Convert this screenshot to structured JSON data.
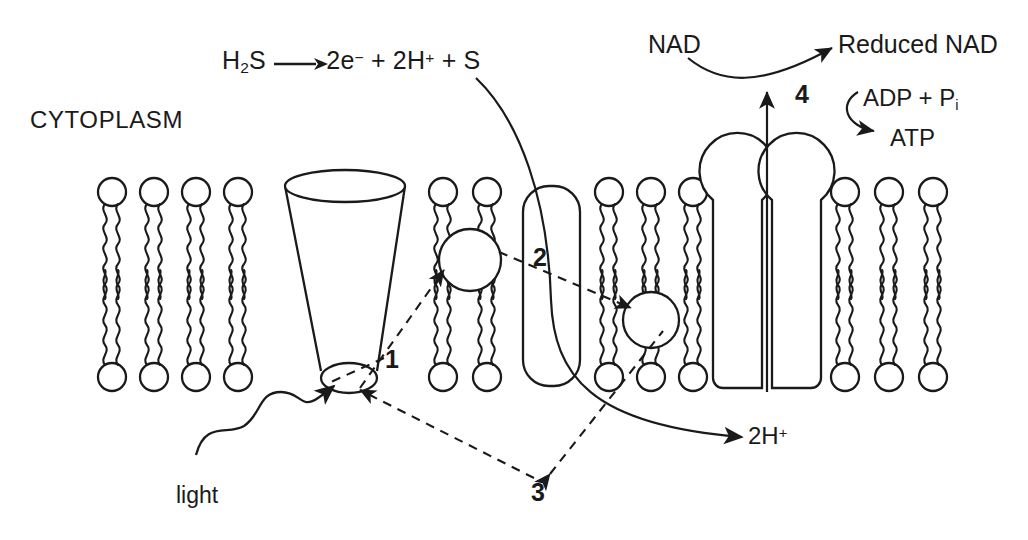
{
  "figure": {
    "kind": "bacterial-membrane-diagram",
    "title_visible": false,
    "stroke_color": "#1a1a1a",
    "fill_color": "#ffffff",
    "background": "#ffffff"
  },
  "labels": {
    "cytoplasm": "CYTOPLASM",
    "light": "light",
    "two_h_plus": "2H",
    "two_h_plus_sup": "+",
    "nad": "NAD",
    "reduced_nad": "Reduced NAD",
    "adp_pi": "ADP + P",
    "adp_pi_sub": "i",
    "atp": "ATP"
  },
  "equation": {
    "reactant": "H",
    "reactant_sub": "2",
    "reactant_tail": "S",
    "arrow": "→",
    "products": "2e",
    "products_sup1": "−",
    "products_mid": " + 2H",
    "products_sup2": "+",
    "products_tail": " + S",
    "full_text": "H2S → 2e− + 2H+ + S"
  },
  "numbered_labels": [
    {
      "id": "1",
      "text": "1",
      "refers_to": "light-harvesting-reaction-centre"
    },
    {
      "id": "2",
      "text": "2",
      "refers_to": "membrane-protein-complex"
    },
    {
      "id": "3",
      "text": "3",
      "refers_to": "electron-carriers"
    },
    {
      "id": "4",
      "text": "4",
      "refers_to": "atp-synthase"
    }
  ],
  "components": {
    "bilayer": {
      "name": "phospholipid-bilayer",
      "upper_leaflet_head_y": 192,
      "lower_leaflet_head_y": 377,
      "head_radius": 14,
      "lipid_groups": [
        {
          "name": "left-lipids",
          "count": 4,
          "x_start": 112,
          "spacing": 42
        },
        {
          "name": "mid-lipids",
          "count": 2,
          "x_start": 443,
          "spacing": 44
        },
        {
          "name": "right-mid-lipids",
          "count": 3,
          "x_start": 609,
          "spacing": 42
        },
        {
          "name": "far-right-lipids",
          "count": 3,
          "x_start": 845,
          "spacing": 44
        }
      ]
    },
    "cone": {
      "name": "light-harvesting-complex",
      "top_cx": 345,
      "top_cy": 186,
      "top_rx": 60,
      "top_ry": 16,
      "bottom_cx": 349,
      "bottom_cy": 378,
      "bottom_rx": 28,
      "bottom_ry": 15
    },
    "carrier_a": {
      "name": "electron-carrier-upper",
      "cx": 470,
      "cy": 260,
      "r": 31
    },
    "carrier_b": {
      "name": "electron-carrier-lower",
      "cx": 651,
      "cy": 320,
      "r": 28
    },
    "protein2": {
      "name": "membrane-protein-complex",
      "x": 523,
      "y": 186,
      "w": 57,
      "h": 200,
      "radius": 26
    },
    "atp_synthase": {
      "name": "atp-synthase",
      "left_head_cx": 722,
      "right_head_cx": 812,
      "head_cy": 135,
      "head_r": 38,
      "channel_x": 767,
      "stalk_top": 96,
      "base_y": 388
    }
  },
  "arrows": {
    "light_squiggle": {
      "name": "light-arrow",
      "from": [
        196,
        452
      ],
      "to": [
        332,
        392
      ]
    },
    "h2s_curve": {
      "name": "h2s-electron-curve",
      "from": [
        476,
        78
      ],
      "to": [
        700,
        440
      ]
    },
    "proton_channel": {
      "name": "proton-flow-arrow",
      "from": [
        767,
        390
      ],
      "to": [
        767,
        92
      ]
    },
    "nad_curve": {
      "name": "nad-reduction-arrow",
      "from": [
        690,
        58
      ],
      "to": [
        830,
        50
      ]
    },
    "atp_curve": {
      "name": "atp-synthesis-arrow",
      "from": [
        855,
        96
      ],
      "to": [
        880,
        131
      ]
    },
    "dashed": [
      {
        "name": "dashed-1-reaction-centre",
        "points": [
          [
            382,
            360
          ],
          [
            330,
            383
          ]
        ]
      },
      {
        "name": "dashed-carrier-a",
        "points": [
          [
            362,
            387
          ],
          [
            441,
            270
          ]
        ]
      },
      {
        "name": "dashed-carrier-b",
        "points": [
          [
            500,
            252
          ],
          [
            632,
            307
          ]
        ]
      },
      {
        "name": "dashed-3-left",
        "points": [
          [
            536,
            481
          ],
          [
            355,
            390
          ]
        ]
      },
      {
        "name": "dashed-3-right",
        "points": [
          [
            548,
            476
          ],
          [
            664,
            330
          ]
        ]
      }
    ]
  }
}
